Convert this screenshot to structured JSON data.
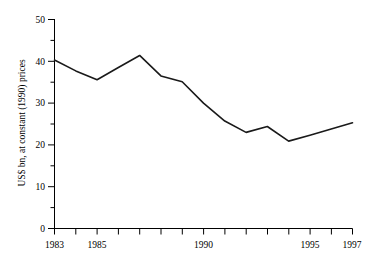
{
  "chart_data": {
    "type": "line",
    "title": "",
    "subtitle": "",
    "xlabel": "",
    "ylabel": "US$ bn, at constant (1990) prices",
    "x": [
      1983,
      1984,
      1985,
      1986,
      1987,
      1988,
      1989,
      1990,
      1991,
      1992,
      1993,
      1994,
      1995,
      1996,
      1997
    ],
    "values": [
      40.3,
      37.7,
      35.6,
      38.5,
      41.4,
      36.5,
      35.1,
      30.0,
      25.7,
      23.0,
      24.4,
      20.9,
      22.3,
      23.8,
      25.3
    ],
    "series": [
      {
        "name": "",
        "values": [
          40.3,
          37.7,
          35.6,
          38.5,
          41.4,
          36.5,
          35.1,
          30.0,
          25.7,
          23.0,
          24.4,
          20.9,
          22.3,
          23.8,
          25.3
        ]
      }
    ],
    "xlim": [
      1983,
      1997
    ],
    "ylim": [
      0,
      50
    ],
    "y_ticks": [
      0,
      10,
      20,
      30,
      40,
      50
    ],
    "y_tick_labels": [
      "0",
      "10",
      "20",
      "30",
      "40",
      "50"
    ],
    "y_minor_ticks": [
      5,
      15,
      25,
      35,
      45
    ],
    "x_ticks": [
      1983,
      1984,
      1985,
      1986,
      1987,
      1988,
      1989,
      1990,
      1991,
      1992,
      1993,
      1994,
      1995,
      1996,
      1997
    ],
    "x_tick_labels_shown": [
      "1983",
      "1985",
      "1990",
      "1995",
      "1997"
    ],
    "x_labeled_values": [
      1983,
      1985,
      1990,
      1995,
      1997
    ],
    "grid": false,
    "legend": false,
    "legend_position": "none",
    "line_color": "#1a1a1a",
    "background_color": "#ffffff",
    "annotations": []
  }
}
